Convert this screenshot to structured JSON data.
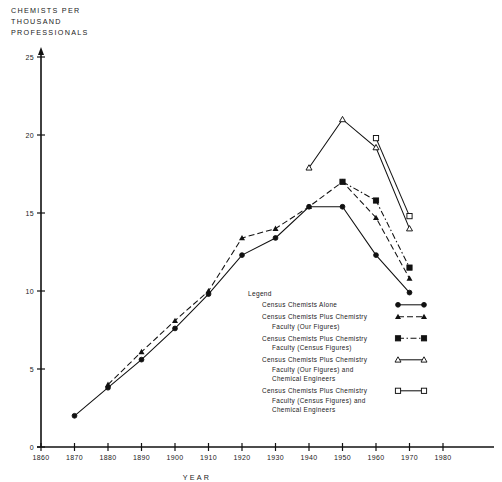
{
  "chart_data": {
    "type": "line",
    "title_lines": [
      "CHEMISTS  PER",
      "THOUSAND",
      "PROFESSIONALS"
    ],
    "xlabel": "YEAR",
    "ylabel": "CHEMISTS PER THOUSAND PROFESSIONALS",
    "xlim": [
      1860,
      1980
    ],
    "ylim": [
      0,
      25
    ],
    "xticks": [
      1860,
      1870,
      1880,
      1890,
      1900,
      1910,
      1920,
      1930,
      1940,
      1950,
      1960,
      1970,
      1980
    ],
    "xtick_labels": [
      "1860",
      "1870",
      "1880",
      "1890",
      "1900",
      "1910",
      "1920",
      "1930",
      "1940",
      "1950",
      "1960",
      "1970",
      "1980"
    ],
    "yticks": [
      0,
      5,
      10,
      15,
      20,
      25
    ],
    "ytick_labels": [
      "0",
      "5",
      "10",
      "15",
      "20",
      "25"
    ],
    "grid": false,
    "legend_position": "center-right",
    "legend_title": "Legend",
    "series": [
      {
        "name": "Census Chemists Alone",
        "label_lines": [
          "Census  Chemists  Alone"
        ],
        "marker": "filled-circle",
        "line_style": "solid",
        "x": [
          1870,
          1880,
          1890,
          1900,
          1910,
          1920,
          1930,
          1940,
          1950,
          1960,
          1970
        ],
        "values": [
          2.0,
          3.8,
          5.6,
          7.6,
          9.8,
          12.3,
          13.4,
          15.4,
          15.4,
          12.3,
          9.9
        ]
      },
      {
        "name": "Census Chemists Plus Chemistry Faculty (Our Figures)",
        "label_lines": [
          "Census  Chemists  Plus  Chemistry",
          "Faculty (Our Figures)"
        ],
        "marker": "filled-triangle",
        "line_style": "dashed",
        "x": [
          1880,
          1890,
          1900,
          1910,
          1920,
          1930,
          1940,
          1950,
          1960,
          1970
        ],
        "values": [
          4.0,
          6.1,
          8.1,
          10.0,
          13.4,
          14.0,
          15.4,
          17.0,
          14.7,
          10.8
        ]
      },
      {
        "name": "Census Chemists Plus Chemistry Faculty (Census Figures)",
        "label_lines": [
          "Census  Chemists  Plus  Chemistry",
          "Faculty (Census  Figures)"
        ],
        "marker": "filled-square",
        "line_style": "dash-dot",
        "x": [
          1950,
          1960,
          1970
        ],
        "values": [
          17.0,
          15.8,
          11.5
        ]
      },
      {
        "name": "Census Chemists Plus Chemistry Faculty (Our Figures) and Chemical Engineers",
        "label_lines": [
          "Census  Chemists  Plus  Chemistry",
          "Faculty (Our  Figures)  and",
          "Chemical  Engineers"
        ],
        "marker": "open-triangle",
        "line_style": "solid",
        "x": [
          1940,
          1950,
          1960,
          1970
        ],
        "values": [
          17.9,
          21.0,
          19.2,
          14.0
        ]
      },
      {
        "name": "Census Chemists Plus Chemistry Faculty (Census Figures) and Chemical Engineers",
        "label_lines": [
          "Census  Chemists  Plus  Chemistry",
          "Faculty (Census  Figures)  and",
          "Chemical  Engineers"
        ],
        "marker": "open-square",
        "line_style": "solid",
        "x": [
          1960,
          1970
        ],
        "values": [
          19.8,
          14.8
        ]
      }
    ]
  },
  "colors": {
    "ink": "#111111",
    "background": "#ffffff"
  }
}
